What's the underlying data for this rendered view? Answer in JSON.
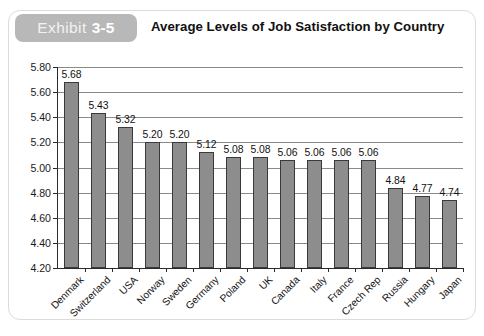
{
  "header": {
    "exhibit_word": "Exhibit",
    "exhibit_number": "3-5",
    "title": "Average Levels of Job Satisfaction by Country",
    "badge_color": "#b8b8b8"
  },
  "chart_data": {
    "type": "bar",
    "title": "Average Levels of Job Satisfaction by Country",
    "xlabel": "",
    "ylabel": "",
    "ylim": [
      4.2,
      5.8
    ],
    "ytick_step": 0.2,
    "grid": true,
    "legend": "none",
    "bar_color": "#8d8d8d",
    "bar_border_color": "#3a3a3a",
    "ytick_labels": [
      "5.80",
      "5.60",
      "5.40",
      "5.20",
      "5.00",
      "4.80",
      "4.60",
      "4.40",
      "4.20"
    ],
    "ytick_values": [
      5.8,
      5.6,
      5.4,
      5.2,
      5.0,
      4.8,
      4.6,
      4.4,
      4.2
    ],
    "categories": [
      "Denmark",
      "Switzerland",
      "USA",
      "Norway",
      "Sweden",
      "Germany",
      "Poland",
      "UK",
      "Canada",
      "Italy",
      "France",
      "Czech Rep",
      "Russia",
      "Hungary",
      "Japan"
    ],
    "values": [
      5.68,
      5.43,
      5.32,
      5.2,
      5.2,
      5.12,
      5.08,
      5.08,
      5.06,
      5.06,
      5.06,
      5.06,
      4.84,
      4.77,
      4.74
    ],
    "value_labels": [
      "5.68",
      "5.43",
      "5.32",
      "5.20",
      "5.20",
      "5.12",
      "5.08",
      "5.08",
      "5.06",
      "5.06",
      "5.06",
      "5.06",
      "4.84",
      "4.77",
      "4.74"
    ]
  }
}
